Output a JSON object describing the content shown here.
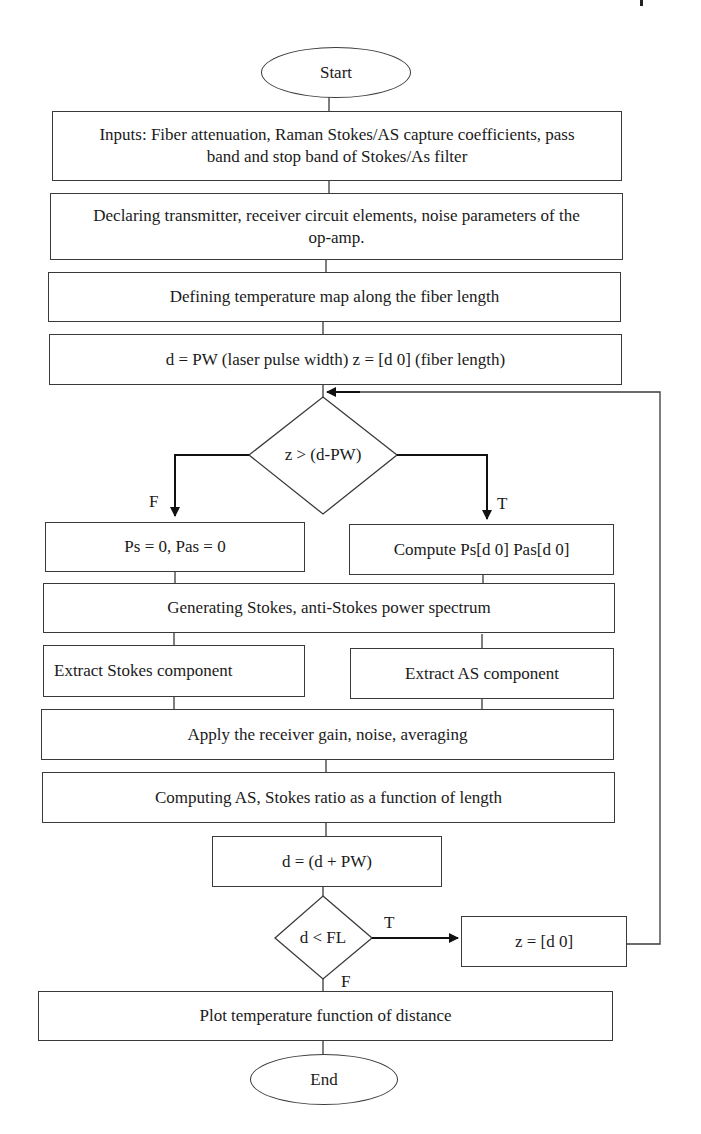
{
  "diagram": {
    "type": "flowchart",
    "nodes": {
      "start": "Start",
      "inputs": "Inputs: Fiber attenuation, Raman Stokes/AS capture coefficients, pass band and stop band of Stokes/As filter",
      "declare": "Declaring transmitter, receiver circuit elements, noise parameters of the op-amp.",
      "temp_map": "Defining temperature map along the fiber length",
      "init": "d = PW (laser pulse width) z = [d 0] (fiber length)",
      "decision_z": "z > (d-PW)",
      "ps_zero": "Ps = 0, Pas = 0",
      "compute_ps": "Compute Ps[d 0] Pas[d 0]",
      "generate_spectrum": "Generating Stokes, anti-Stokes power spectrum",
      "extract_stokes": "Extract Stokes component",
      "extract_as": "Extract AS component",
      "apply_gain": "Apply the receiver gain, noise, averaging",
      "compute_ratio": "Computing AS, Stokes ratio as a function of length",
      "increment_d": "d = (d + PW)",
      "decision_d": "d < FL",
      "reset_z": "z = [d 0]",
      "plot": "Plot temperature function of distance",
      "end": "End"
    },
    "edge_labels": {
      "z_false": "F",
      "z_true": "T",
      "d_true": "T",
      "d_false": "F"
    },
    "edges": [
      {
        "from": "start",
        "to": "inputs"
      },
      {
        "from": "inputs",
        "to": "declare"
      },
      {
        "from": "declare",
        "to": "temp_map"
      },
      {
        "from": "temp_map",
        "to": "init"
      },
      {
        "from": "init",
        "to": "decision_z"
      },
      {
        "from": "decision_z",
        "to": "ps_zero",
        "label": "F"
      },
      {
        "from": "decision_z",
        "to": "compute_ps",
        "label": "T"
      },
      {
        "from": "ps_zero",
        "to": "generate_spectrum"
      },
      {
        "from": "compute_ps",
        "to": "generate_spectrum"
      },
      {
        "from": "generate_spectrum",
        "to": "extract_stokes"
      },
      {
        "from": "generate_spectrum",
        "to": "extract_as"
      },
      {
        "from": "extract_stokes",
        "to": "apply_gain"
      },
      {
        "from": "extract_as",
        "to": "apply_gain"
      },
      {
        "from": "apply_gain",
        "to": "compute_ratio"
      },
      {
        "from": "compute_ratio",
        "to": "increment_d"
      },
      {
        "from": "increment_d",
        "to": "decision_d"
      },
      {
        "from": "decision_d",
        "to": "reset_z",
        "label": "T"
      },
      {
        "from": "reset_z",
        "to": "decision_z"
      },
      {
        "from": "decision_d",
        "to": "plot",
        "label": "F"
      },
      {
        "from": "plot",
        "to": "end"
      }
    ]
  }
}
